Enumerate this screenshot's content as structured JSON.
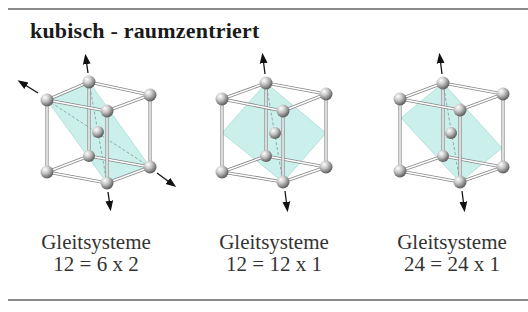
{
  "title": "kubisch - raumzentriert",
  "colors": {
    "plane_fill": "#b9ebe6",
    "rule": "#8a8a8a",
    "atom": "#9a9a9a"
  },
  "cells": [
    {
      "label": "Gleitsysteme",
      "formula": "12 = 6 x 2"
    },
    {
      "label": "Gleitsysteme",
      "formula": "12 = 12 x 1"
    },
    {
      "label": "Gleitsysteme",
      "formula": "24 = 24 x 1"
    }
  ]
}
